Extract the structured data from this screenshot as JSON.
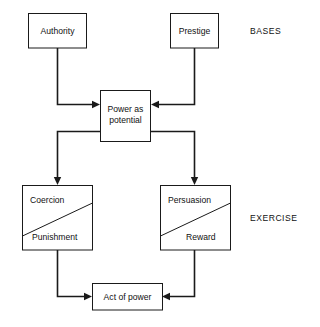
{
  "diagram": {
    "type": "flowchart",
    "background_color": "#ffffff",
    "line_color": "#1a1a1a",
    "text_color": "#111111",
    "section_labels": [
      {
        "id": "bases",
        "text": "BASES"
      },
      {
        "id": "exercise",
        "text": "EXERCISE"
      }
    ],
    "nodes": [
      {
        "id": "authority",
        "label": "Authority",
        "shape": "rect",
        "tier": "bases"
      },
      {
        "id": "prestige",
        "label": "Prestige",
        "shape": "rect",
        "tier": "bases"
      },
      {
        "id": "power-as-potential",
        "label_line1": "Power as",
        "label_line2": "potential",
        "shape": "rect",
        "tier": "middle"
      },
      {
        "id": "coercion-punishment",
        "label_top": "Coercion",
        "label_bottom": "Punishment",
        "shape": "rect-split-diagonal",
        "tier": "exercise"
      },
      {
        "id": "persuasion-reward",
        "label_top": "Persuasion",
        "label_bottom": "Reward",
        "shape": "rect-split-diagonal",
        "tier": "exercise"
      },
      {
        "id": "act-of-power",
        "label": "Act of power",
        "shape": "rect",
        "tier": "outcome"
      }
    ],
    "edges": [
      {
        "id": "authority-to-power",
        "from": "authority",
        "to": "power-as-potential",
        "arrow": true
      },
      {
        "id": "prestige-to-power",
        "from": "prestige",
        "to": "power-as-potential",
        "arrow": true
      },
      {
        "id": "power-to-coercion",
        "from": "power-as-potential",
        "to": "coercion-punishment",
        "arrow": true
      },
      {
        "id": "power-to-persuasion",
        "from": "power-as-potential",
        "to": "persuasion-reward",
        "arrow": true
      },
      {
        "id": "coercion-to-act",
        "from": "coercion-punishment",
        "to": "act-of-power",
        "arrow": true
      },
      {
        "id": "persuasion-to-act",
        "from": "persuasion-reward",
        "to": "act-of-power",
        "arrow": true
      }
    ]
  }
}
